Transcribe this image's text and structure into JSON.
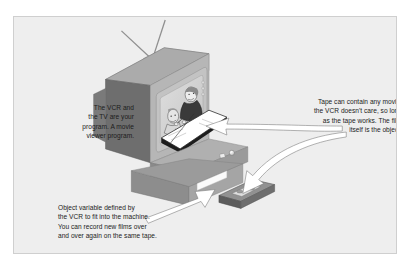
{
  "figure": {
    "panel_background": "#eeeeee",
    "border_color": "#cfcfcf",
    "text_color": "#1c1c1c"
  },
  "captions": {
    "left": "The VCR and\nthe TV are your\nprogram. A movie\nviewer program.",
    "right": "Tape can contain any movie,\nthe VCR doesn't care, so long\nas the tape works. The film\nitself is the object.",
    "bottom": "Object variable defined by\nthe VCR to fit into the machine.\nYou can record new films over\nand over again on the same tape."
  },
  "illustration": {
    "television": {
      "label": "television-set",
      "front_panel_color": "#b4b4b4",
      "side_panel_color": "#6e6e6e",
      "top_panel_color": "#a9a9a9",
      "screen_color": "#d4d4d4",
      "bezel_color": "#c8c8c8"
    },
    "antenna": {
      "label": "rabbit-ear-antenna",
      "rod_color": "#8a8a8a",
      "base_color": "#9a9a9a",
      "rod_count": 2
    },
    "vcr": {
      "label": "vcr-deck",
      "body_color": "#9e9e9e",
      "face_color": "#b2b2b2",
      "slot_color": "#f5f5f5",
      "knob_color": "#e8e8e8"
    },
    "stand": {
      "label": "tv-stand",
      "top_color": "#9b9b9b",
      "front_color": "#8d8d8d"
    },
    "screen_scene": {
      "label": "broadcast-scene",
      "figure_left": "seated-viewer",
      "figure_right": "presenter",
      "document": "open-book"
    },
    "tape": {
      "label": "vhs-cassette",
      "top_color": "#8e8e8e",
      "side_color": "#5e5e5e",
      "window_color": "#e4e4e4"
    },
    "arrows": [
      {
        "name": "arrow-to-screen-film",
        "style": "curved-white"
      },
      {
        "name": "arrow-to-tape-from-right",
        "style": "curved-white"
      },
      {
        "name": "arrow-to-tape-from-bottom",
        "style": "straight-white"
      }
    ]
  }
}
